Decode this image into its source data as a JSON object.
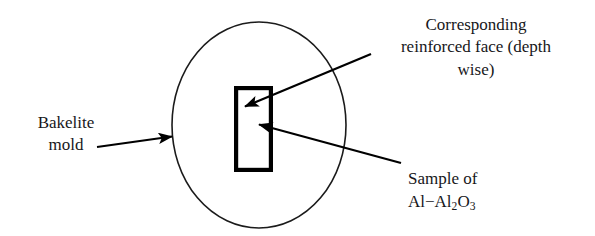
{
  "figure": {
    "kind": "schematic-diagram",
    "background_color": "#ffffff",
    "stroke_color": "#000000",
    "text_color": "#17171a"
  },
  "shapes": {
    "mold": {
      "name": "bakelite-mold-ellipse",
      "type": "ellipse",
      "center_x": 259,
      "center_y": 125,
      "radius_x": 87,
      "radius_y": 103,
      "stroke_width": 1.6,
      "fill": "none"
    },
    "sample": {
      "name": "sample-rectangle",
      "type": "rectangle",
      "x": 234,
      "y": 86,
      "width": 39,
      "height": 86,
      "stroke_width": 4.2,
      "fill": "none"
    }
  },
  "arrows": [
    {
      "name": "arrow-bakelite-mold",
      "from_x": 97,
      "from_y": 147,
      "to_x": 174,
      "to_y": 136,
      "points_to": "bakelite-mold-ellipse",
      "stroke_width": 2.2
    },
    {
      "name": "arrow-reinforced-face",
      "from_x": 371,
      "from_y": 54,
      "to_x": 242,
      "to_y": 108,
      "points_to": "sample-rectangle-left-face",
      "stroke_width": 2.2
    },
    {
      "name": "arrow-sample",
      "from_x": 401,
      "from_y": 163,
      "to_x": 256,
      "to_y": 124,
      "points_to": "sample-rectangle-interior",
      "stroke_width": 2.2
    }
  ],
  "labels": {
    "bakelite_mold": "Bakelite\nmold",
    "reinforced_face": "Corresponding\nreinforced face (depth\nwise)",
    "sample_title": "Sample of",
    "sample_formula_prefix": "Al−Al",
    "sample_formula_sub1": "2",
    "sample_formula_mid": "O",
    "sample_formula_sub2": "3"
  }
}
